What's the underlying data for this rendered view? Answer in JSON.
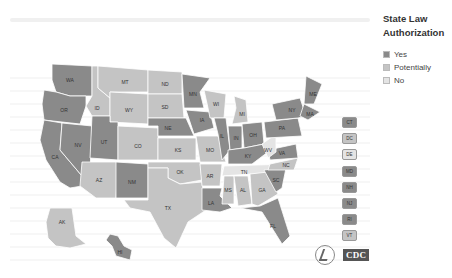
{
  "legend": {
    "title_line1": "State Law",
    "title_line2": "Authorization",
    "items": [
      {
        "label": "Yes",
        "color": "#8a8a8a"
      },
      {
        "label": "Potentially",
        "color": "#c4c4c4"
      },
      {
        "label": "No",
        "color": "#e4e4e4"
      }
    ]
  },
  "colors": {
    "yes": "#8a8a8a",
    "potentially": "#c4c4c4",
    "no": "#e4e4e4"
  },
  "states": {
    "WA": "yes",
    "OR": "yes",
    "CA": "yes",
    "NV": "yes",
    "ID": "potentially",
    "MT": "potentially",
    "WY": "potentially",
    "UT": "yes",
    "AZ": "potentially",
    "CO": "potentially",
    "NM": "yes",
    "ND": "potentially",
    "SD": "potentially",
    "NE": "yes",
    "KS": "potentially",
    "OK": "potentially",
    "TX": "potentially",
    "MN": "yes",
    "IA": "yes",
    "MO": "potentially",
    "AR": "potentially",
    "LA": "yes",
    "WI": "potentially",
    "IL": "yes",
    "MI": "potentially",
    "IN": "yes",
    "OH": "yes",
    "KY": "yes",
    "TN": "no",
    "MS": "potentially",
    "AL": "potentially",
    "GA": "potentially",
    "FL": "yes",
    "SC": "yes",
    "NC": "potentially",
    "VA": "yes",
    "WV": "no",
    "PA": "yes",
    "NY": "yes",
    "ME": "yes",
    "MA": "yes",
    "AK": "potentially",
    "HI": "yes"
  },
  "small_states": [
    {
      "code": "CT",
      "status": "yes"
    },
    {
      "code": "DC",
      "status": "potentially"
    },
    {
      "code": "DE",
      "status": "no"
    },
    {
      "code": "MD",
      "status": "yes"
    },
    {
      "code": "NH",
      "status": "yes"
    },
    {
      "code": "NJ",
      "status": "yes"
    },
    {
      "code": "RI",
      "status": "yes"
    },
    {
      "code": "VT",
      "status": "potentially"
    }
  ],
  "logos": {
    "cdc": "CDC"
  }
}
